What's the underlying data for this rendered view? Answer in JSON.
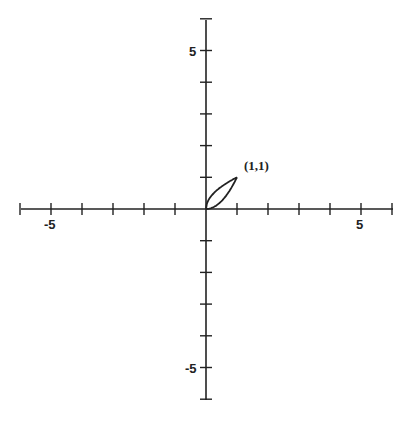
{
  "chart_data": {
    "type": "line",
    "title": "",
    "xlabel": "",
    "ylabel": "",
    "xlim": [
      -6,
      6
    ],
    "ylim": [
      -6,
      6
    ],
    "grid": false,
    "x_tick_labels": [
      "-5",
      "5"
    ],
    "y_tick_labels": [
      "5",
      "-5"
    ],
    "series": [
      {
        "name": "upper curve (y = sqrt(x))",
        "x": [
          0,
          0.1,
          0.25,
          0.5,
          0.75,
          1
        ],
        "y": [
          0,
          0.316,
          0.5,
          0.707,
          0.866,
          1
        ]
      },
      {
        "name": "lower curve (y = x^2)",
        "x": [
          0,
          0.25,
          0.5,
          0.75,
          1
        ],
        "y": [
          0,
          0.0625,
          0.25,
          0.5625,
          1
        ]
      }
    ],
    "annotations": [
      {
        "text": "(1,1)",
        "x": 1,
        "y": 1
      }
    ]
  }
}
